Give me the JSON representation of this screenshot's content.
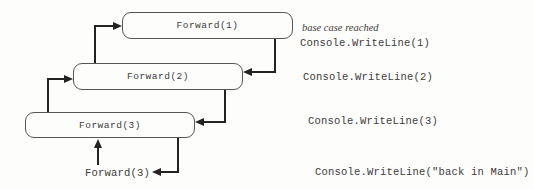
{
  "diagram": {
    "title_hint": "recursion call/return trace",
    "frames": [
      {
        "label": "Forward(1)"
      },
      {
        "label": "Forward(2)"
      },
      {
        "label": "Forward(3)"
      }
    ],
    "initial_call_label": "Forward(3)",
    "annotations": [
      {
        "text": "base case reached",
        "style": "italic-handnote"
      },
      {
        "text": "Console.WriteLine(1)",
        "style": "code"
      },
      {
        "text": "Console.WriteLine(2)",
        "style": "code"
      },
      {
        "text": "Console.WriteLine(3)",
        "style": "code"
      },
      {
        "text": "Console.WriteLine(\"back in Main\")",
        "style": "code"
      }
    ],
    "colors": {
      "background": "#fdfdfb",
      "line": "#232323",
      "box_border": "#555555",
      "text": "#3c3c3c"
    }
  }
}
